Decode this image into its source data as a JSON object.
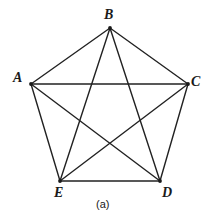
{
  "figure": {
    "caption": "(a)",
    "kind": "complete-graph-K5",
    "stroke_color": "#222222",
    "background_color": "#ffffff",
    "vertex_dot_color": "#1a1a1a"
  },
  "chart_data": {
    "type": "diagram",
    "title": "(a)",
    "graph": "K5 complete graph drawn as a regular pentagon with all five diagonals (pentagram)",
    "vertices": [
      {
        "id": "A",
        "label": "A",
        "x": 31,
        "y": 84
      },
      {
        "id": "B",
        "label": "B",
        "x": 110,
        "y": 28
      },
      {
        "id": "C",
        "label": "C",
        "x": 188,
        "y": 84
      },
      {
        "id": "D",
        "label": "D",
        "x": 160,
        "y": 181
      },
      {
        "id": "E",
        "label": "E",
        "x": 60,
        "y": 181
      }
    ],
    "edges": [
      {
        "from": "A",
        "to": "B",
        "kind": "side"
      },
      {
        "from": "B",
        "to": "C",
        "kind": "side"
      },
      {
        "from": "C",
        "to": "D",
        "kind": "side"
      },
      {
        "from": "D",
        "to": "E",
        "kind": "side"
      },
      {
        "from": "E",
        "to": "A",
        "kind": "side"
      },
      {
        "from": "A",
        "to": "C",
        "kind": "diagonal"
      },
      {
        "from": "A",
        "to": "D",
        "kind": "diagonal"
      },
      {
        "from": "B",
        "to": "D",
        "kind": "diagonal"
      },
      {
        "from": "B",
        "to": "E",
        "kind": "diagonal"
      },
      {
        "from": "C",
        "to": "E",
        "kind": "diagonal"
      }
    ],
    "vertex_count": 5,
    "edge_count": 10,
    "xlim": [
      0,
      214
    ],
    "ylim": [
      0,
      222
    ],
    "grid": false,
    "legend": "none"
  }
}
